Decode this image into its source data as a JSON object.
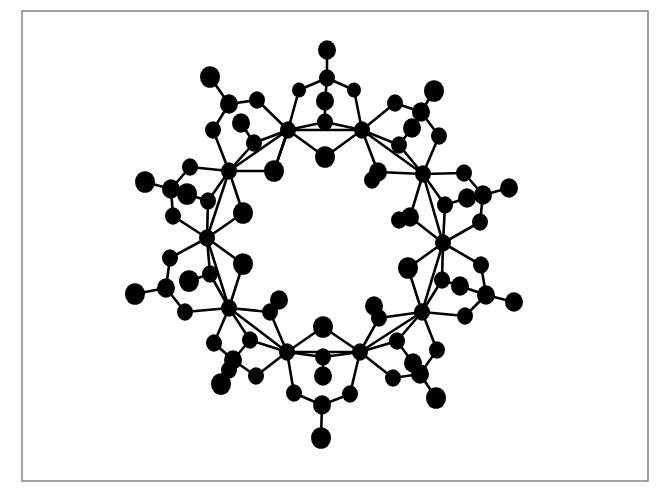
{
  "figure": {
    "type": "ball-and-stick molecular structure",
    "frame": {
      "x": 22,
      "y": 11,
      "width": 626,
      "height": 470,
      "color": "#7a7a7a"
    },
    "atom_color": "#000000",
    "background": "#ffffff"
  },
  "atoms": [
    {
      "id": "M1",
      "x": 288,
      "y": 130,
      "r": 8,
      "kind": "metal"
    },
    {
      "id": "M2",
      "x": 362,
      "y": 130,
      "r": 8,
      "kind": "metal"
    },
    {
      "id": "M3",
      "x": 423,
      "y": 174,
      "r": 8,
      "kind": "metal"
    },
    {
      "id": "M4",
      "x": 443,
      "y": 243,
      "r": 8,
      "kind": "metal"
    },
    {
      "id": "M5",
      "x": 422,
      "y": 312,
      "r": 8,
      "kind": "metal"
    },
    {
      "id": "M6",
      "x": 360,
      "y": 352,
      "r": 8,
      "kind": "metal"
    },
    {
      "id": "M7",
      "x": 287,
      "y": 352,
      "r": 8,
      "kind": "metal"
    },
    {
      "id": "M8",
      "x": 229,
      "y": 308,
      "r": 8,
      "kind": "metal"
    },
    {
      "id": "M9",
      "x": 207,
      "y": 238,
      "r": 8,
      "kind": "metal"
    },
    {
      "id": "M10",
      "x": 229,
      "y": 171,
      "r": 8,
      "kind": "metal"
    },
    {
      "id": "T1",
      "x": 327,
      "y": 50,
      "r": 9,
      "kind": "terminal"
    },
    {
      "id": "C1",
      "x": 327,
      "y": 78,
      "r": 8,
      "kind": "carbon"
    },
    {
      "id": "a1",
      "x": 299,
      "y": 90,
      "r": 7,
      "kind": "oxygen"
    },
    {
      "id": "a2",
      "x": 354,
      "y": 90,
      "r": 7,
      "kind": "oxygen"
    },
    {
      "id": "b1",
      "x": 325,
      "y": 101,
      "r": 9,
      "kind": "oxygen"
    },
    {
      "id": "b2",
      "x": 325,
      "y": 122,
      "r": 8,
      "kind": "oxygen"
    },
    {
      "id": "b3",
      "x": 325,
      "y": 157,
      "r": 10,
      "kind": "oxygen"
    },
    {
      "id": "T2",
      "x": 210,
      "y": 77,
      "r": 10,
      "kind": "terminal"
    },
    {
      "id": "C2",
      "x": 229,
      "y": 104,
      "r": 9,
      "kind": "carbon"
    },
    {
      "id": "c1",
      "x": 257,
      "y": 100,
      "r": 8,
      "kind": "oxygen"
    },
    {
      "id": "c2",
      "x": 213,
      "y": 130,
      "r": 8,
      "kind": "oxygen"
    },
    {
      "id": "c3",
      "x": 241,
      "y": 123,
      "r": 9,
      "kind": "oxygen"
    },
    {
      "id": "c4",
      "x": 254,
      "y": 143,
      "r": 8,
      "kind": "oxygen"
    },
    {
      "id": "c5",
      "x": 274,
      "y": 171,
      "r": 10,
      "kind": "oxygen"
    },
    {
      "id": "T3",
      "x": 434,
      "y": 91,
      "r": 10,
      "kind": "terminal"
    },
    {
      "id": "C3",
      "x": 421,
      "y": 112,
      "r": 9,
      "kind": "carbon"
    },
    {
      "id": "d1",
      "x": 395,
      "y": 103,
      "r": 8,
      "kind": "oxygen"
    },
    {
      "id": "d2",
      "x": 412,
      "y": 128,
      "r": 9,
      "kind": "oxygen"
    },
    {
      "id": "d3",
      "x": 439,
      "y": 136,
      "r": 8,
      "kind": "oxygen"
    },
    {
      "id": "d4",
      "x": 399,
      "y": 145,
      "r": 8,
      "kind": "oxygen"
    },
    {
      "id": "d5",
      "x": 378,
      "y": 172,
      "r": 9,
      "kind": "oxygen"
    },
    {
      "id": "d6",
      "x": 372,
      "y": 180,
      "r": 8,
      "kind": "oxygen"
    },
    {
      "id": "T4",
      "x": 509,
      "y": 188,
      "r": 9,
      "kind": "terminal"
    },
    {
      "id": "C4",
      "x": 483,
      "y": 195,
      "r": 9,
      "kind": "carbon"
    },
    {
      "id": "e1",
      "x": 464,
      "y": 173,
      "r": 8,
      "kind": "oxygen"
    },
    {
      "id": "e2",
      "x": 467,
      "y": 198,
      "r": 9,
      "kind": "oxygen"
    },
    {
      "id": "e3",
      "x": 445,
      "y": 205,
      "r": 8,
      "kind": "oxygen"
    },
    {
      "id": "e4",
      "x": 480,
      "y": 222,
      "r": 8,
      "kind": "oxygen"
    },
    {
      "id": "e5",
      "x": 410,
      "y": 217,
      "r": 9,
      "kind": "oxygen"
    },
    {
      "id": "e6",
      "x": 399,
      "y": 220,
      "r": 8,
      "kind": "oxygen"
    },
    {
      "id": "T5",
      "x": 514,
      "y": 302,
      "r": 9,
      "kind": "terminal"
    },
    {
      "id": "C5",
      "x": 486,
      "y": 295,
      "r": 9,
      "kind": "carbon"
    },
    {
      "id": "f1",
      "x": 481,
      "y": 265,
      "r": 8,
      "kind": "oxygen"
    },
    {
      "id": "f2",
      "x": 460,
      "y": 286,
      "r": 9,
      "kind": "oxygen"
    },
    {
      "id": "f3",
      "x": 442,
      "y": 280,
      "r": 8,
      "kind": "oxygen"
    },
    {
      "id": "f4",
      "x": 408,
      "y": 268,
      "r": 10,
      "kind": "oxygen"
    },
    {
      "id": "f5",
      "x": 465,
      "y": 316,
      "r": 8,
      "kind": "oxygen"
    },
    {
      "id": "T6",
      "x": 436,
      "y": 398,
      "r": 10,
      "kind": "terminal"
    },
    {
      "id": "C6",
      "x": 420,
      "y": 374,
      "r": 9,
      "kind": "carbon"
    },
    {
      "id": "g1",
      "x": 437,
      "y": 350,
      "r": 8,
      "kind": "oxygen"
    },
    {
      "id": "g2",
      "x": 413,
      "y": 363,
      "r": 9,
      "kind": "oxygen"
    },
    {
      "id": "g3",
      "x": 397,
      "y": 341,
      "r": 8,
      "kind": "oxygen"
    },
    {
      "id": "g4",
      "x": 393,
      "y": 378,
      "r": 8,
      "kind": "oxygen"
    },
    {
      "id": "g5",
      "x": 374,
      "y": 306,
      "r": 9,
      "kind": "oxygen"
    },
    {
      "id": "g6",
      "x": 379,
      "y": 318,
      "r": 8,
      "kind": "oxygen"
    },
    {
      "id": "T7",
      "x": 321,
      "y": 438,
      "r": 10,
      "kind": "terminal"
    },
    {
      "id": "C7",
      "x": 322,
      "y": 405,
      "r": 9,
      "kind": "carbon"
    },
    {
      "id": "h1",
      "x": 294,
      "y": 393,
      "r": 8,
      "kind": "oxygen"
    },
    {
      "id": "h2",
      "x": 350,
      "y": 394,
      "r": 8,
      "kind": "oxygen"
    },
    {
      "id": "h3",
      "x": 323,
      "y": 327,
      "r": 10,
      "kind": "oxygen"
    },
    {
      "id": "h4",
      "x": 323,
      "y": 357,
      "r": 8,
      "kind": "oxygen"
    },
    {
      "id": "h5",
      "x": 323,
      "y": 376,
      "r": 9,
      "kind": "oxygen"
    },
    {
      "id": "T8",
      "x": 221,
      "y": 384,
      "r": 10,
      "kind": "terminal"
    },
    {
      "id": "C8",
      "x": 233,
      "y": 360,
      "r": 9,
      "kind": "carbon"
    },
    {
      "id": "i1",
      "x": 214,
      "y": 343,
      "r": 8,
      "kind": "oxygen"
    },
    {
      "id": "i2",
      "x": 250,
      "y": 340,
      "r": 8,
      "kind": "oxygen"
    },
    {
      "id": "i3",
      "x": 256,
      "y": 376,
      "r": 8,
      "kind": "oxygen"
    },
    {
      "id": "i4",
      "x": 279,
      "y": 300,
      "r": 9,
      "kind": "oxygen"
    },
    {
      "id": "i5",
      "x": 270,
      "y": 312,
      "r": 8,
      "kind": "oxygen"
    },
    {
      "id": "i6",
      "x": 229,
      "y": 370,
      "r": 8,
      "kind": "oxygen"
    },
    {
      "id": "T9",
      "x": 135,
      "y": 294,
      "r": 10,
      "kind": "terminal"
    },
    {
      "id": "C9",
      "x": 166,
      "y": 288,
      "r": 9,
      "kind": "carbon"
    },
    {
      "id": "j1",
      "x": 170,
      "y": 258,
      "r": 8,
      "kind": "oxygen"
    },
    {
      "id": "j2",
      "x": 189,
      "y": 281,
      "r": 10,
      "kind": "oxygen"
    },
    {
      "id": "j3",
      "x": 210,
      "y": 274,
      "r": 8,
      "kind": "oxygen"
    },
    {
      "id": "j4",
      "x": 185,
      "y": 312,
      "r": 8,
      "kind": "oxygen"
    },
    {
      "id": "j5",
      "x": 243,
      "y": 264,
      "r": 10,
      "kind": "oxygen"
    },
    {
      "id": "T10",
      "x": 145,
      "y": 182,
      "r": 10,
      "kind": "terminal"
    },
    {
      "id": "C10",
      "x": 171,
      "y": 189,
      "r": 9,
      "kind": "carbon"
    },
    {
      "id": "k1",
      "x": 190,
      "y": 167,
      "r": 8,
      "kind": "oxygen"
    },
    {
      "id": "k2",
      "x": 187,
      "y": 194,
      "r": 10,
      "kind": "oxygen"
    },
    {
      "id": "k3",
      "x": 208,
      "y": 201,
      "r": 8,
      "kind": "oxygen"
    },
    {
      "id": "k4",
      "x": 173,
      "y": 216,
      "r": 8,
      "kind": "oxygen"
    },
    {
      "id": "k5",
      "x": 243,
      "y": 213,
      "r": 10,
      "kind": "oxygen"
    }
  ],
  "bonds": [
    [
      "T1",
      "C1"
    ],
    [
      "C1",
      "a1"
    ],
    [
      "C1",
      "a2"
    ],
    [
      "C1",
      "b1"
    ],
    [
      "b1",
      "b2"
    ],
    [
      "a1",
      "M1"
    ],
    [
      "a2",
      "M2"
    ],
    [
      "b2",
      "M1"
    ],
    [
      "b2",
      "M2"
    ],
    [
      "b3",
      "M1"
    ],
    [
      "b3",
      "M2"
    ],
    [
      "T2",
      "C2"
    ],
    [
      "C2",
      "c1"
    ],
    [
      "C2",
      "c2"
    ],
    [
      "c1",
      "M1"
    ],
    [
      "c2",
      "M10"
    ],
    [
      "c3",
      "c4"
    ],
    [
      "c4",
      "M1"
    ],
    [
      "c4",
      "M10"
    ],
    [
      "M1",
      "M10"
    ],
    [
      "c5",
      "M1"
    ],
    [
      "c5",
      "M10"
    ],
    [
      "M1",
      "c5"
    ],
    [
      "T3",
      "C3"
    ],
    [
      "C3",
      "d1"
    ],
    [
      "C3",
      "d3"
    ],
    [
      "C3",
      "d2"
    ],
    [
      "d1",
      "M2"
    ],
    [
      "d3",
      "M3"
    ],
    [
      "d4",
      "M2"
    ],
    [
      "d4",
      "M3"
    ],
    [
      "M2",
      "d5"
    ],
    [
      "d5",
      "M3"
    ],
    [
      "d2",
      "d4"
    ],
    [
      "M2",
      "M3"
    ],
    [
      "T4",
      "C4"
    ],
    [
      "C4",
      "e1"
    ],
    [
      "C4",
      "e4"
    ],
    [
      "C4",
      "e2"
    ],
    [
      "e1",
      "M3"
    ],
    [
      "e4",
      "M4"
    ],
    [
      "e3",
      "M3"
    ],
    [
      "e3",
      "M4"
    ],
    [
      "e5",
      "M3"
    ],
    [
      "e5",
      "M4"
    ],
    [
      "e2",
      "e3"
    ],
    [
      "T5",
      "C5"
    ],
    [
      "C5",
      "f1"
    ],
    [
      "C5",
      "f5"
    ],
    [
      "C5",
      "f2"
    ],
    [
      "f1",
      "M4"
    ],
    [
      "f5",
      "M5"
    ],
    [
      "f3",
      "M4"
    ],
    [
      "f3",
      "M5"
    ],
    [
      "f4",
      "M4"
    ],
    [
      "f4",
      "M5"
    ],
    [
      "f2",
      "f3"
    ],
    [
      "T6",
      "C6"
    ],
    [
      "C6",
      "g1"
    ],
    [
      "C6",
      "g4"
    ],
    [
      "C6",
      "g2"
    ],
    [
      "g1",
      "M5"
    ],
    [
      "g4",
      "M6"
    ],
    [
      "g3",
      "M5"
    ],
    [
      "g3",
      "M6"
    ],
    [
      "g6",
      "M5"
    ],
    [
      "g6",
      "M6"
    ],
    [
      "g2",
      "g3"
    ],
    [
      "T7",
      "C7"
    ],
    [
      "C7",
      "h1"
    ],
    [
      "C7",
      "h2"
    ],
    [
      "h1",
      "M7"
    ],
    [
      "h2",
      "M6"
    ],
    [
      "h3",
      "M6"
    ],
    [
      "h3",
      "M7"
    ],
    [
      "h4",
      "M6"
    ],
    [
      "h4",
      "M7"
    ],
    [
      "h4",
      "h5"
    ],
    [
      "T8",
      "C8"
    ],
    [
      "C8",
      "i1"
    ],
    [
      "C8",
      "i3"
    ],
    [
      "i1",
      "M8"
    ],
    [
      "i3",
      "M7"
    ],
    [
      "i2",
      "M8"
    ],
    [
      "i2",
      "M7"
    ],
    [
      "i5",
      "M8"
    ],
    [
      "i5",
      "M7"
    ],
    [
      "i4",
      "i5"
    ],
    [
      "C8",
      "i2"
    ],
    [
      "T9",
      "C9"
    ],
    [
      "C9",
      "j1"
    ],
    [
      "C9",
      "j4"
    ],
    [
      "j1",
      "M9"
    ],
    [
      "j4",
      "M8"
    ],
    [
      "j3",
      "M9"
    ],
    [
      "j3",
      "M8"
    ],
    [
      "j5",
      "M9"
    ],
    [
      "j5",
      "M8"
    ],
    [
      "j2",
      "j3"
    ],
    [
      "T10",
      "C10"
    ],
    [
      "C10",
      "k1"
    ],
    [
      "C10",
      "k4"
    ],
    [
      "k1",
      "M10"
    ],
    [
      "k4",
      "M9"
    ],
    [
      "k3",
      "M10"
    ],
    [
      "k3",
      "M9"
    ],
    [
      "k5",
      "M10"
    ],
    [
      "k5",
      "M9"
    ],
    [
      "k2",
      "k3"
    ],
    [
      "M10",
      "M9"
    ],
    [
      "M9",
      "M8"
    ],
    [
      "M8",
      "M7"
    ],
    [
      "M3",
      "M4"
    ],
    [
      "M4",
      "M5"
    ],
    [
      "M5",
      "M6"
    ],
    [
      "M1",
      "M2"
    ],
    [
      "M6",
      "M7"
    ]
  ]
}
